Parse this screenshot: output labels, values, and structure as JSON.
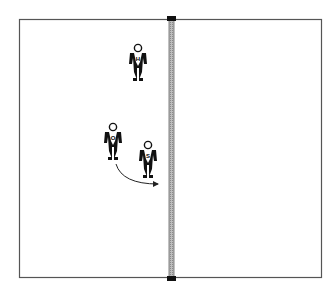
{
  "diagram": {
    "type": "volleyball-court-drill",
    "colors": {
      "background": "#ffffff",
      "court_line": "#555555",
      "net": "#aaaaaa",
      "net_post": "#111111",
      "player": "#111111",
      "arrow": "#222222"
    },
    "court": {
      "x": 19,
      "y": 19,
      "width": 303,
      "height": 259
    },
    "net": {
      "x": 169,
      "y": 19,
      "width": 5,
      "height": 259
    },
    "players": [
      {
        "id": "player-h",
        "label": "H",
        "x": 138,
        "y": 48
      },
      {
        "id": "player-o",
        "label": "O",
        "x": 113,
        "y": 127
      },
      {
        "id": "player-s",
        "label": "S",
        "x": 148,
        "y": 145
      }
    ],
    "arrow": {
      "from": "player-o",
      "to": "net",
      "description": "curved movement arrow toward net"
    }
  }
}
